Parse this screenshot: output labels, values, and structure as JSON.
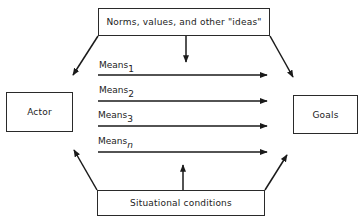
{
  "diagram": {
    "type": "flow",
    "nodes": {
      "norms": {
        "label": "Norms, values, and other \"ideas\""
      },
      "actor": {
        "label": "Actor"
      },
      "goals": {
        "label": "Goals"
      },
      "situational": {
        "label": "Situational conditions"
      }
    },
    "means": [
      {
        "base": "Means",
        "sub": "1"
      },
      {
        "base": "Means",
        "sub": "2"
      },
      {
        "base": "Means",
        "sub": "3"
      },
      {
        "base": "Means",
        "sub": "n"
      }
    ],
    "edges": [
      {
        "from": "norms",
        "to": "means",
        "style": "arrow-down"
      },
      {
        "from": "norms",
        "to": "actor",
        "style": "diagonal-arrow"
      },
      {
        "from": "norms",
        "to": "goals",
        "style": "diagonal-arrow"
      },
      {
        "from": "situational",
        "to": "means",
        "style": "arrow-up"
      },
      {
        "from": "situational",
        "to": "actor",
        "style": "diagonal-arrow"
      },
      {
        "from": "situational",
        "to": "goals",
        "style": "diagonal-arrow"
      },
      {
        "from": "actor",
        "to": "goals",
        "via": "means_1"
      },
      {
        "from": "actor",
        "to": "goals",
        "via": "means_2"
      },
      {
        "from": "actor",
        "to": "goals",
        "via": "means_3"
      },
      {
        "from": "actor",
        "to": "goals",
        "via": "means_n"
      }
    ],
    "colors": {
      "line": "#1a1a1a",
      "background": "#ffffff"
    }
  }
}
